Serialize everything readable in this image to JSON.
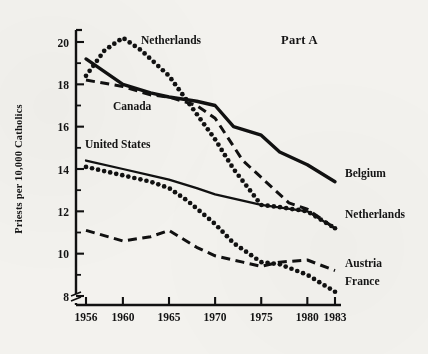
{
  "chart_data": {
    "type": "line",
    "title": "Part A",
    "xlabel": "",
    "ylabel": "Priests per 10,000 Catholics",
    "xlim": [
      1955,
      1984
    ],
    "ylim": [
      7.4,
      20.6
    ],
    "grid": false,
    "axis_break": true,
    "legend_position": "inline-right",
    "x_ticks": [
      1956,
      1960,
      1965,
      1970,
      1975,
      1980,
      1983
    ],
    "x_tick_labels": [
      "1956",
      "1960",
      "1965",
      "1970",
      "1975",
      "1980",
      "1983"
    ],
    "y_ticks": [
      8,
      10,
      12,
      14,
      16,
      18,
      20
    ],
    "y_tick_labels": [
      "8",
      "10",
      "12",
      "14",
      "16",
      "18",
      "20"
    ],
    "y_minor_ticks": [
      9,
      11,
      13,
      15,
      17,
      19
    ],
    "series": [
      {
        "name": "Belgium",
        "style": "solid-thick",
        "label_anchor": "right",
        "x": [
          1956,
          1958,
          1960,
          1963,
          1965,
          1968,
          1970,
          1972,
          1975,
          1977,
          1980,
          1983
        ],
        "values": [
          19.2,
          18.6,
          18.0,
          17.6,
          17.4,
          17.2,
          17.0,
          16.0,
          15.6,
          14.8,
          14.2,
          13.4
        ]
      },
      {
        "name": "Netherlands",
        "style": "dotted",
        "label_anchor": "right",
        "x": [
          1956,
          1958,
          1960,
          1962,
          1965,
          1967,
          1970,
          1972,
          1975,
          1977,
          1980,
          1983
        ],
        "values": [
          18.4,
          19.6,
          20.2,
          19.6,
          18.4,
          17.2,
          15.4,
          14.0,
          12.3,
          12.2,
          12.0,
          11.2
        ]
      },
      {
        "name": "Canada",
        "style": "dashed",
        "label_anchor": "inline",
        "x": [
          1956,
          1960,
          1963,
          1965,
          1968,
          1970,
          1973,
          1975,
          1978,
          1980,
          1983
        ],
        "values": [
          18.2,
          17.9,
          17.5,
          17.4,
          17.0,
          16.4,
          14.4,
          13.6,
          12.4,
          12.1,
          11.2
        ]
      },
      {
        "name": "United States",
        "style": "solid-thin",
        "label_anchor": "inline",
        "x": [
          1956,
          1960,
          1963,
          1965,
          1968,
          1970,
          1975,
          1980,
          1983
        ],
        "values": [
          14.4,
          14.0,
          13.7,
          13.5,
          13.1,
          12.8,
          12.3,
          12.0,
          11.2
        ]
      },
      {
        "name": "France",
        "style": "dotted",
        "label_anchor": "right",
        "x": [
          1956,
          1958,
          1960,
          1963,
          1965,
          1967,
          1970,
          1972,
          1975,
          1977,
          1980,
          1983
        ],
        "values": [
          14.1,
          13.9,
          13.7,
          13.4,
          13.1,
          12.5,
          11.4,
          10.5,
          9.6,
          9.5,
          9.0,
          8.2
        ]
      },
      {
        "name": "Austria",
        "style": "dashed",
        "label_anchor": "right",
        "x": [
          1956,
          1960,
          1963,
          1965,
          1968,
          1970,
          1973,
          1975,
          1977,
          1980,
          1983
        ],
        "values": [
          11.1,
          10.6,
          10.8,
          11.1,
          10.3,
          9.9,
          9.6,
          9.4,
          9.6,
          9.7,
          9.2
        ]
      }
    ],
    "annotations": [
      {
        "text": "Netherlands",
        "x_px": 141,
        "y_px": 44
      },
      {
        "text": "Canada",
        "x_px": 113,
        "y_px": 110
      },
      {
        "text": "United States",
        "x_px": 85,
        "y_px": 148
      },
      {
        "text": "Part A",
        "x_px": 281,
        "y_px": 44
      },
      {
        "text": "Belgium",
        "x_px": 345,
        "y_px": 177
      },
      {
        "text": "Netherlands",
        "x_px": 345,
        "y_px": 218
      },
      {
        "text": "Austria",
        "x_px": 345,
        "y_px": 267
      },
      {
        "text": "France",
        "x_px": 345,
        "y_px": 285
      }
    ]
  }
}
